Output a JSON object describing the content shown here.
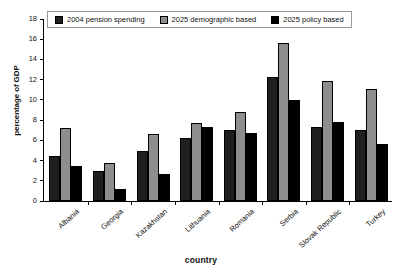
{
  "chart_data": {
    "type": "bar",
    "title": "",
    "xlabel": "country",
    "ylabel": "percentage of GDP",
    "ylim": [
      0,
      18
    ],
    "ytick_step": 2,
    "yticks": [
      0,
      2,
      4,
      6,
      8,
      10,
      12,
      14,
      16,
      18
    ],
    "grid": false,
    "legend_position": "top-inside",
    "categories": [
      "Albania",
      "Georgia",
      "Kazakhstan",
      "Lithuania",
      "Romania",
      "Serbia",
      "Slovak Republic",
      "Turkey"
    ],
    "series": [
      {
        "name": "2004 pension spending",
        "color": "#1f1f1f",
        "values": [
          4.5,
          3.0,
          4.9,
          6.2,
          7.0,
          12.3,
          7.3,
          7.0
        ]
      },
      {
        "name": "2025 demographic based",
        "color": "#8e8e8e",
        "values": [
          7.2,
          3.8,
          6.6,
          7.7,
          8.8,
          15.6,
          11.9,
          11.1
        ]
      },
      {
        "name": "2025 policy based",
        "color": "#000000",
        "values": [
          3.5,
          1.2,
          2.7,
          7.3,
          6.7,
          10.0,
          7.8,
          5.6
        ]
      }
    ]
  }
}
